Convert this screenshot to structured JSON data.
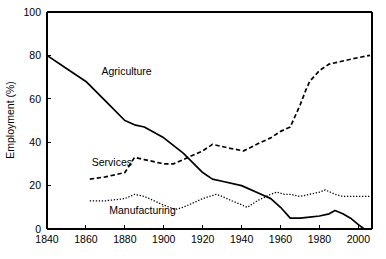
{
  "chart_data": {
    "type": "line",
    "title": "",
    "subtitle": "",
    "xlabel": "",
    "ylabel": "Employment (%)",
    "xlim": [
      1840,
      2007
    ],
    "ylim": [
      0,
      100
    ],
    "grid": false,
    "legend_position": "inline-labels",
    "xticks": [
      1840,
      1860,
      1880,
      1900,
      1920,
      1940,
      1960,
      1980,
      2000
    ],
    "xticklabels": [
      "1840",
      "1860",
      "1880",
      "1900",
      "1920",
      "1940",
      "1960",
      "1980",
      "2000"
    ],
    "yticks": [
      0,
      20,
      40,
      60,
      80,
      100
    ],
    "yticklabels": [
      "0",
      "20",
      "40",
      "60",
      "80",
      "100"
    ],
    "series": [
      {
        "name": "Agriculture",
        "style": "solid",
        "label_x": 1868,
        "label_y": 71,
        "x": [
          1840,
          1850,
          1860,
          1870,
          1880,
          1885,
          1890,
          1900,
          1910,
          1920,
          1925,
          1930,
          1940,
          1950,
          1955,
          1960,
          1965,
          1970,
          1975,
          1980,
          1985,
          1988,
          1992,
          1996,
          2000,
          2003
        ],
        "y": [
          80,
          74,
          68,
          59,
          50,
          48,
          47,
          42,
          35,
          26,
          23,
          22,
          20,
          16,
          14,
          10,
          5,
          5,
          5.5,
          6,
          7,
          8.5,
          7,
          5,
          2,
          0
        ]
      },
      {
        "name": "Services",
        "style": "dashed",
        "label_x": 1863,
        "label_y": 29,
        "x": [
          1862,
          1870,
          1880,
          1885,
          1890,
          1900,
          1905,
          1910,
          1920,
          1925,
          1930,
          1935,
          1941,
          1950,
          1955,
          1960,
          1965,
          1970,
          1973,
          1975,
          1980,
          1985,
          1990,
          1995,
          2000,
          2006
        ],
        "y": [
          23,
          24,
          26,
          33,
          32,
          30,
          30,
          32,
          36,
          39,
          38,
          37,
          36,
          40,
          42,
          45,
          47,
          57,
          64,
          68,
          73,
          76,
          77,
          78,
          79,
          80
        ]
      },
      {
        "name": "Manufacturing",
        "style": "dotted",
        "label_x": 1872,
        "label_y": 7,
        "x": [
          1862,
          1870,
          1880,
          1885,
          1890,
          1900,
          1906,
          1910,
          1915,
          1920,
          1927,
          1930,
          1935,
          1943,
          1948,
          1955,
          1958,
          1962,
          1965,
          1970,
          1975,
          1980,
          1983,
          1988,
          1992,
          1996,
          2000,
          2006
        ],
        "y": [
          13,
          13,
          14,
          16,
          15,
          11,
          9,
          10,
          12,
          14,
          16,
          15,
          13,
          10,
          13,
          16,
          17,
          16,
          16,
          15,
          16,
          17,
          18,
          16,
          15,
          15,
          15,
          15
        ]
      }
    ]
  },
  "labels": {
    "y_axis_title": "Employment (%)"
  }
}
